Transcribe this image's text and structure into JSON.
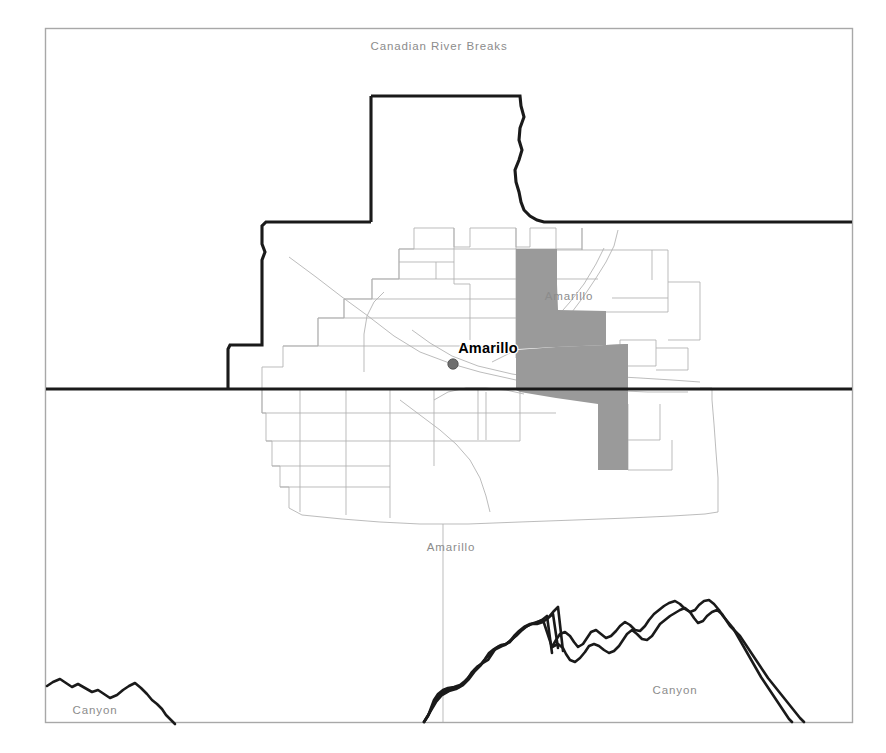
{
  "map": {
    "title": "Amarillo Area Reference Map",
    "frame": {
      "x": 45,
      "y": 28,
      "width": 808,
      "height": 695,
      "border_color": "#a8a8a8"
    },
    "background_color": "#ffffff",
    "labels": [
      {
        "name": "canadian-river-breaks",
        "text": "Canadian River Breaks",
        "x": 439,
        "y": 50,
        "style": "place-gray",
        "anchor": "middle"
      },
      {
        "name": "amarillo-gray-northeast",
        "text": "Amarillo",
        "x": 569,
        "y": 300,
        "style": "place-gray",
        "anchor": "middle"
      },
      {
        "name": "amarillo-city-main",
        "text": "Amarillo",
        "x": 488,
        "y": 353,
        "style": "city-bold",
        "anchor": "middle"
      },
      {
        "name": "amarillo-gray-south",
        "text": "Amarillo",
        "x": 451,
        "y": 551,
        "style": "place-gray",
        "anchor": "middle"
      },
      {
        "name": "canyon-southwest",
        "text": "Canyon",
        "x": 95,
        "y": 714,
        "style": "place-gray",
        "anchor": "middle"
      },
      {
        "name": "canyon-southeast",
        "text": "Canyon",
        "x": 675,
        "y": 694,
        "style": "place-gray",
        "anchor": "middle"
      }
    ],
    "city_marker": {
      "name": "amarillo-city-dot",
      "x": 453,
      "y": 364,
      "radius": 5.2,
      "color": "#6f6f6f"
    },
    "shaded_region": {
      "name": "highlighted-census-tracts",
      "fill": "#9a9a9a",
      "description": "Shaded tract group east of central Amarillo"
    },
    "legend_colors": {
      "heavy_boundary": "#1a1a1a",
      "city_boundary": "#b0b0b0",
      "shaded_fill": "#9a9a9a",
      "label_gray": "#8c8c8c"
    }
  }
}
